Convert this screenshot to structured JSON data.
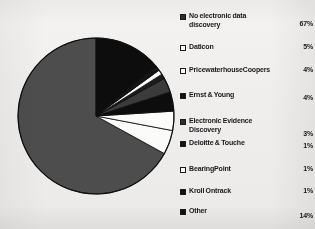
{
  "chart_data": {
    "type": "pie",
    "title": "",
    "legend_position": "right",
    "categories": [
      "No electronic data discovery",
      "Daticon",
      "PricewaterhouseCoopers",
      "Ernst & Young",
      "Electronic Evidence Discovery",
      "Deloitte & Touche",
      "BearingPoint",
      "Kroll Ontrack",
      "Other"
    ],
    "values": [
      67,
      5,
      4,
      4,
      3,
      1,
      1,
      1,
      14
    ],
    "value_labels": [
      "67%",
      "5%",
      "4%",
      "4%",
      "3%",
      "1%",
      "1%",
      "1%",
      "14%"
    ],
    "unit": "%",
    "colors": [
      "#4d4d4d",
      "#fbfbfa",
      "#fbfbfa",
      "#111111",
      "#3a3a3a",
      "#1c1c1c",
      "#fbfbfa",
      "#141414",
      "#0d0d0d"
    ]
  },
  "legend": {
    "items": [
      {
        "label": "No electronic data\ndiscovery",
        "value": "67%",
        "swatch": "swatch-dark-icon",
        "style": "sw-dark",
        "top": 4,
        "value_top": 12
      },
      {
        "label": "Daticon",
        "value": "5%",
        "swatch": "swatch-hollow-icon",
        "style": "sw-hollow",
        "top": 35,
        "value_top": 35
      },
      {
        "label": "PricewaterhouseCoopers",
        "value": "4%",
        "swatch": "swatch-hollow-icon",
        "style": "sw-hollow",
        "top": 58,
        "value_top": 58
      },
      {
        "label": "Ernst & Young",
        "value": "4%",
        "swatch": "swatch-solid-icon",
        "style": "sw-solid",
        "top": 83,
        "value_top": 86
      },
      {
        "label": "Electronic Evidence\nDiscovery",
        "value": "3%",
        "swatch": "swatch-dark-icon",
        "style": "sw-dark",
        "top": 109,
        "value_top": 122
      },
      {
        "label": "Deloitte & Touche",
        "value": "1%",
        "swatch": "swatch-solid-icon",
        "style": "sw-solid",
        "top": 131,
        "value_top": 134
      },
      {
        "label": "BearingPoint",
        "value": "1%",
        "swatch": "swatch-hollow-icon",
        "style": "sw-hollow",
        "top": 157,
        "value_top": 157
      },
      {
        "label": "Kroll Ontrack",
        "value": "1%",
        "swatch": "swatch-solid-icon",
        "style": "sw-solid",
        "top": 179,
        "value_top": 179
      },
      {
        "label": "Other",
        "value": "14%",
        "swatch": "swatch-solid-icon",
        "style": "sw-solid",
        "top": 199,
        "value_top": 204
      }
    ]
  },
  "pie": {
    "center_x": 88,
    "center_y": 90,
    "radius": 78,
    "start_angle_deg": -90,
    "direction": "counterclockwise"
  }
}
